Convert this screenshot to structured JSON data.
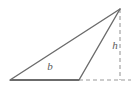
{
  "figure": {
    "kind": "geometry-diagram",
    "background_color": "#ffffff",
    "solid_stroke_color": "#6b6b6b",
    "dashed_stroke_color": "#9a9a9a",
    "label_color": "#5a5a5a",
    "solid_stroke_width": 1.4,
    "base_stroke_width": 2.0,
    "dash_pattern": "4,3"
  },
  "labels": {
    "base": "b",
    "height": "h"
  },
  "points": {
    "left_vertex": {
      "name": "left-vertex",
      "x": 10,
      "y": 80
    },
    "base_right_vertex": {
      "name": "base-right-vertex",
      "x": 79,
      "y": 80
    },
    "apex": {
      "name": "apex",
      "x": 120,
      "y": 9
    },
    "foot_of_height": {
      "name": "foot-of-height",
      "x": 120,
      "y": 80
    },
    "baseline_extension_end": {
      "name": "baseline-extension-end",
      "x": 131,
      "y": 80
    }
  },
  "segments": {
    "base": {
      "name": "base-segment",
      "style": "solid",
      "x1": 10,
      "y1": 80,
      "x2": 79,
      "y2": 80
    },
    "hypotenuse": {
      "name": "long-side-segment",
      "style": "solid",
      "x1": 10,
      "y1": 80,
      "x2": 120,
      "y2": 9
    },
    "right_side": {
      "name": "right-side-segment",
      "style": "solid",
      "x1": 79,
      "y1": 80,
      "x2": 120,
      "y2": 9
    },
    "height_line": {
      "name": "height-dashed-segment",
      "style": "dashed",
      "x1": 120,
      "y1": 9,
      "x2": 120,
      "y2": 80
    },
    "base_extension": {
      "name": "base-extension-dashed-segment",
      "style": "dashed",
      "x1": 79,
      "y1": 80,
      "x2": 131,
      "y2": 80
    }
  },
  "label_positions": {
    "base": {
      "x": 50,
      "y": 70
    },
    "height": {
      "x": 115,
      "y": 49
    }
  }
}
